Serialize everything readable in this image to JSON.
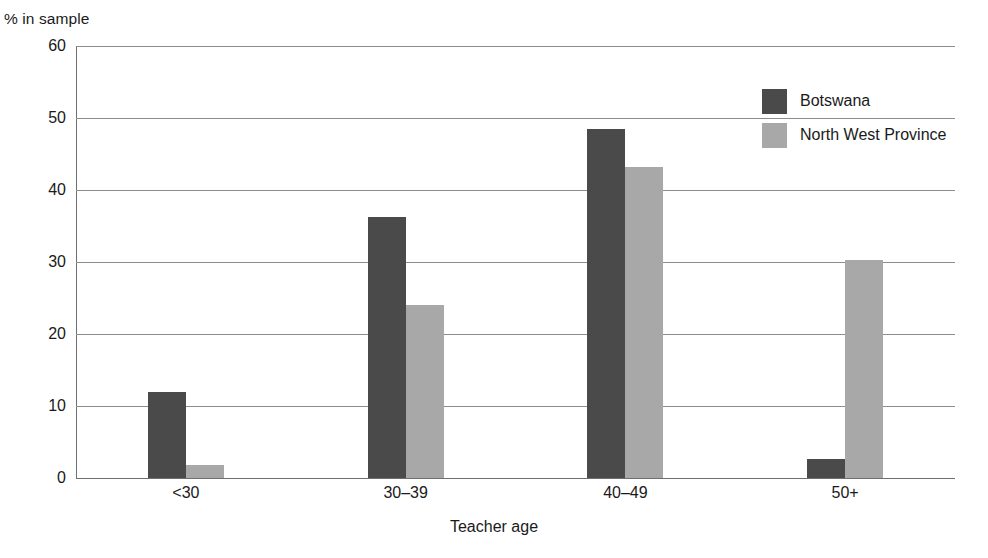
{
  "chart_data": {
    "type": "bar",
    "title": "",
    "xlabel": "Teacher age",
    "ylabel": "% in sample",
    "categories": [
      "<30",
      "30–39",
      "40–49",
      "50+"
    ],
    "series": [
      {
        "name": "Botswana",
        "color": "#4a4a4a",
        "values": [
          11.9,
          36.2,
          48.5,
          2.7
        ]
      },
      {
        "name": "North West Province",
        "color": "#a8a8a8",
        "values": [
          1.8,
          24.0,
          43.2,
          30.3
        ]
      }
    ],
    "ylim": [
      0,
      60
    ],
    "yticks": [
      0,
      10,
      20,
      30,
      40,
      50,
      60
    ],
    "ytick_labels": [
      "0",
      "10",
      "20",
      "30",
      "40",
      "50",
      "60"
    ],
    "grid": true,
    "grid_axis": "y",
    "legend_position": "top-right",
    "bar_gap": "grouped-adjacent"
  },
  "legend": {
    "entries": [
      {
        "label": "Botswana",
        "color": "#4a4a4a"
      },
      {
        "label": "North West Province",
        "color": "#a8a8a8"
      }
    ]
  },
  "axes": {
    "y_title": "% in sample",
    "x_title": "Teacher age"
  }
}
